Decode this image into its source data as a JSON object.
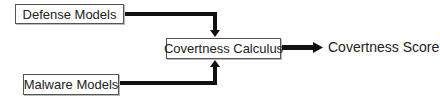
{
  "diagram": {
    "nodes": {
      "defense_models": "Defense Models",
      "malware_models": "Malware Models",
      "covertness_calculus": "Covertness Calculus",
      "covertness_score": "Covertness Score"
    },
    "edges": [
      {
        "from": "Defense Models",
        "to": "Covertness Calculus"
      },
      {
        "from": "Malware Models",
        "to": "Covertness Calculus"
      },
      {
        "from": "Covertness Calculus",
        "to": "Covertness Score"
      }
    ],
    "colors": {
      "arrow": "#111111",
      "box_border": "#555555",
      "text": "#222222"
    }
  }
}
